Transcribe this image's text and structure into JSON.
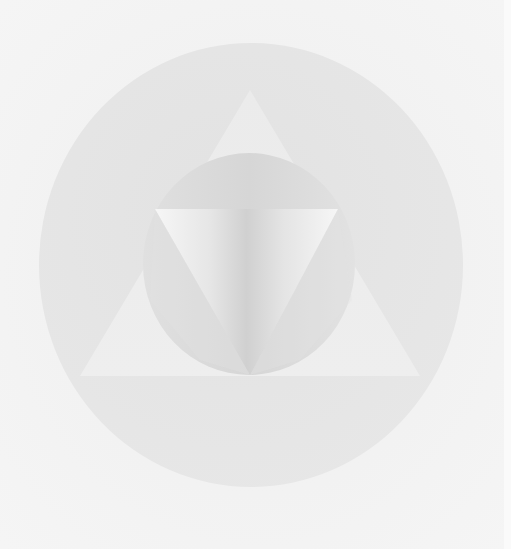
{
  "artwork": {
    "title": "",
    "description": "Abstract geometric composition: circle containing triangle containing circle containing inverted triangle, in soft greys",
    "colors": {
      "background": "#f3f3f3",
      "outer_circle": "#e4e4e4",
      "triangle": "#ececec",
      "inner_circle": "#d9d9d9",
      "inner_circle_light": "#e6e6e6",
      "inverted_triangle_edge": "#f4f4f4",
      "inverted_triangle_center": "#d2d2d2"
    }
  }
}
